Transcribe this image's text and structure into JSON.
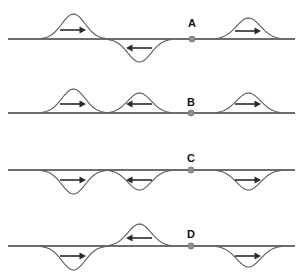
{
  "figure": {
    "title": "",
    "background_color": "#ffffff",
    "width": 302,
    "height": 272,
    "wave_color": "#5a5a5a",
    "baseline_color": "#3d3d3d",
    "arrow_color": "#2b2b2b",
    "dot_color": "#8f8f94",
    "label_color": "#111111"
  },
  "rows": [
    {
      "label": "A",
      "label_x": 192,
      "label_y": 27,
      "baseline_y": 39,
      "baseline_x1": 8,
      "baseline_x2": 295,
      "marker": {
        "name": "point-a",
        "x": 192,
        "y": 39,
        "r": 3
      },
      "pulses": [
        {
          "name": "pulse-a-1",
          "start": 42,
          "end": 105,
          "amplitude": 25,
          "orientation": "up",
          "arrow_direction": "right",
          "arrow_x": 73,
          "arrow_y": 30,
          "arrow_len": 26
        },
        {
          "name": "pulse-a-2",
          "start": 108,
          "end": 171,
          "amplitude": 23,
          "orientation": "down",
          "arrow_direction": "left",
          "arrow_x": 139,
          "arrow_y": 48,
          "arrow_len": 26
        },
        {
          "name": "pulse-a-3",
          "start": 216,
          "end": 281,
          "amplitude": 21,
          "orientation": "up",
          "arrow_direction": "right",
          "arrow_x": 248,
          "arrow_y": 31,
          "arrow_len": 26
        }
      ]
    },
    {
      "label": "B",
      "label_x": 191,
      "label_y": 106,
      "baseline_y": 113,
      "baseline_x1": 8,
      "baseline_x2": 295,
      "marker": {
        "name": "point-b",
        "x": 191,
        "y": 113,
        "r": 3
      },
      "pulses": [
        {
          "name": "pulse-b-1",
          "start": 42,
          "end": 105,
          "amplitude": 24,
          "orientation": "up",
          "arrow_direction": "right",
          "arrow_x": 73,
          "arrow_y": 104,
          "arrow_len": 26
        },
        {
          "name": "pulse-b-2",
          "start": 108,
          "end": 171,
          "amplitude": 20,
          "orientation": "up",
          "arrow_direction": "left",
          "arrow_x": 139,
          "arrow_y": 104,
          "arrow_len": 26
        },
        {
          "name": "pulse-b-3",
          "start": 216,
          "end": 281,
          "amplitude": 20,
          "orientation": "up",
          "arrow_direction": "right",
          "arrow_x": 248,
          "arrow_y": 104,
          "arrow_len": 26
        }
      ]
    },
    {
      "label": "C",
      "label_x": 191,
      "label_y": 162,
      "baseline_y": 170,
      "baseline_x1": 8,
      "baseline_x2": 295,
      "marker": {
        "name": "point-c",
        "x": 191,
        "y": 170,
        "r": 3
      },
      "pulses": [
        {
          "name": "pulse-c-1",
          "start": 42,
          "end": 105,
          "amplitude": 24,
          "orientation": "down",
          "arrow_direction": "right",
          "arrow_x": 73,
          "arrow_y": 180,
          "arrow_len": 26
        },
        {
          "name": "pulse-c-2",
          "start": 108,
          "end": 171,
          "amplitude": 20,
          "orientation": "down",
          "arrow_direction": "left",
          "arrow_x": 139,
          "arrow_y": 180,
          "arrow_len": 26
        },
        {
          "name": "pulse-c-3",
          "start": 216,
          "end": 281,
          "amplitude": 20,
          "orientation": "down",
          "arrow_direction": "right",
          "arrow_x": 248,
          "arrow_y": 180,
          "arrow_len": 26
        }
      ]
    },
    {
      "label": "D",
      "label_x": 191,
      "label_y": 238,
      "baseline_y": 246,
      "baseline_x1": 8,
      "baseline_x2": 295,
      "marker": {
        "name": "point-d",
        "x": 191,
        "y": 246,
        "r": 3
      },
      "pulses": [
        {
          "name": "pulse-d-1",
          "start": 42,
          "end": 105,
          "amplitude": 24,
          "orientation": "down",
          "arrow_direction": "right",
          "arrow_x": 73,
          "arrow_y": 256,
          "arrow_len": 26
        },
        {
          "name": "pulse-d-2",
          "start": 108,
          "end": 171,
          "amplitude": 22,
          "orientation": "up",
          "arrow_direction": "left",
          "arrow_x": 139,
          "arrow_y": 238,
          "arrow_len": 26
        },
        {
          "name": "pulse-d-3",
          "start": 216,
          "end": 281,
          "amplitude": 21,
          "orientation": "down",
          "arrow_direction": "right",
          "arrow_x": 248,
          "arrow_y": 256,
          "arrow_len": 26
        }
      ]
    }
  ]
}
